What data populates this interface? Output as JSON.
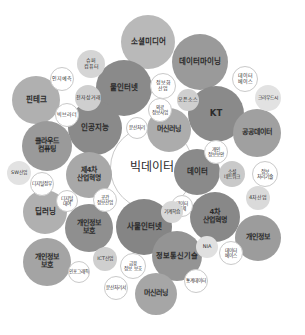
{
  "chart_data": {
    "type": "bubble",
    "title": "",
    "subtitle": "",
    "xlabel": "",
    "ylabel": "",
    "grid": false,
    "legend": "none",
    "palette": {
      "dark_gray": "#7d7d7d",
      "mid_gray": "#9a9a9a",
      "light_gray": "#b9b9b9",
      "pale_gray": "#d5d5d5",
      "very_pale": "#e8e8e8",
      "outline_white": "#ffffff",
      "outline_stroke": "#c9c9c9",
      "text": "#2b2b2b",
      "background": "#ffffff"
    },
    "bubbles": [
      {
        "label": "빅데이터",
        "cx": 152,
        "cy": 168,
        "r": 42,
        "fill": "#ffffff",
        "style": "outline",
        "font": 12,
        "weight": 400
      },
      {
        "label": "소셜미디어",
        "cx": 148,
        "cy": 42,
        "r": 27,
        "fill": "#b9b9b9",
        "style": "solid",
        "font": 7.5,
        "weight": 700
      },
      {
        "label": "데이터마이닝",
        "cx": 200,
        "cy": 62,
        "r": 28,
        "fill": "#9a9a9a",
        "style": "solid",
        "font": 7.5,
        "weight": 700
      },
      {
        "label": "물인터넷",
        "cx": 124,
        "cy": 88,
        "r": 28,
        "fill": "#8a8a8a",
        "style": "solid",
        "font": 7.5,
        "weight": 700
      },
      {
        "label": "KT",
        "cx": 216,
        "cy": 114,
        "r": 28,
        "fill": "#8a8a8a",
        "style": "solid",
        "font": 8.5,
        "weight": 700
      },
      {
        "label": "핀테크",
        "cx": 36,
        "cy": 100,
        "r": 24,
        "fill": "#b0b0b0",
        "style": "solid",
        "font": 7.5,
        "weight": 700
      },
      {
        "label": "인공지능",
        "cx": 95,
        "cy": 128,
        "r": 27,
        "fill": "#8a8a8a",
        "style": "solid",
        "font": 7.5,
        "weight": 700
      },
      {
        "label": "머신러닝",
        "cx": 169,
        "cy": 130,
        "r": 22,
        "fill": "#acacac",
        "style": "solid",
        "font": 7,
        "weight": 700
      },
      {
        "label": "공공데이터",
        "cx": 257,
        "cy": 133,
        "r": 24,
        "fill": "#a0a0a0",
        "style": "solid",
        "font": 7,
        "weight": 700
      },
      {
        "label": "클라우드\n컴퓨팅",
        "cx": 47,
        "cy": 146,
        "r": 25,
        "fill": "#9a9a9a",
        "style": "solid",
        "font": 7,
        "weight": 700
      },
      {
        "label": "제4차\n산업혁명",
        "cx": 89,
        "cy": 175,
        "r": 23,
        "fill": "#a8a8a8",
        "style": "solid",
        "font": 6.8,
        "weight": 700
      },
      {
        "label": "데이터",
        "cx": 197,
        "cy": 172,
        "r": 23,
        "fill": "#8a8a8a",
        "style": "solid",
        "font": 7.5,
        "weight": 700
      },
      {
        "label": "4차\n산업혁명",
        "cx": 215,
        "cy": 217,
        "r": 25,
        "fill": "#888888",
        "style": "solid",
        "font": 7,
        "weight": 700
      },
      {
        "label": "딥러닝",
        "cx": 45,
        "cy": 212,
        "r": 22,
        "fill": "#b0b0b0",
        "style": "solid",
        "font": 7.5,
        "weight": 700
      },
      {
        "label": "개인정보\n보호",
        "cx": 89,
        "cy": 228,
        "r": 24,
        "fill": "#8f8f8f",
        "style": "solid",
        "font": 7,
        "weight": 700
      },
      {
        "label": "사물인터넷",
        "cx": 144,
        "cy": 227,
        "r": 28,
        "fill": "#858585",
        "style": "solid",
        "font": 7.5,
        "weight": 700
      },
      {
        "label": "개인정보",
        "cx": 258,
        "cy": 238,
        "r": 23,
        "fill": "#9c9c9c",
        "style": "solid",
        "font": 7,
        "weight": 700
      },
      {
        "label": "개인정보\n보호",
        "cx": 47,
        "cy": 262,
        "r": 24,
        "fill": "#a4a4a4",
        "style": "solid",
        "font": 7,
        "weight": 700
      },
      {
        "label": "정보통신기술",
        "cx": 177,
        "cy": 256,
        "r": 25,
        "fill": "#949494",
        "style": "solid",
        "font": 7.2,
        "weight": 700
      },
      {
        "label": "머신러닝",
        "cx": 156,
        "cy": 294,
        "r": 21,
        "fill": "#a6a6a6",
        "style": "solid",
        "font": 7,
        "weight": 700
      },
      {
        "label": "슈퍼\n컴퓨터",
        "cx": 91,
        "cy": 64,
        "r": 14,
        "fill": "#d5d5d5",
        "style": "solid",
        "font": 5,
        "weight": 400
      },
      {
        "label": "인지예측",
        "cx": 62,
        "cy": 79,
        "r": 12,
        "fill": "#ffffff",
        "style": "outline",
        "font": 5,
        "weight": 400
      },
      {
        "label": "전자상거래",
        "cx": 88,
        "cy": 98,
        "r": 13,
        "fill": "#cfcfcf",
        "style": "solid",
        "font": 5,
        "weight": 400
      },
      {
        "label": "빅브라더",
        "cx": 67,
        "cy": 115,
        "r": 12,
        "fill": "#ffffff",
        "style": "outline",
        "font": 5,
        "weight": 400
      },
      {
        "label": "정보화\n산업",
        "cx": 163,
        "cy": 86,
        "r": 13,
        "fill": "#ffffff",
        "style": "outline",
        "font": 5,
        "weight": 400
      },
      {
        "label": "의료\n정보사업",
        "cx": 160,
        "cy": 110,
        "r": 12,
        "fill": "#ffffff",
        "style": "outline",
        "font": 4.6,
        "weight": 400
      },
      {
        "label": "오픈소스",
        "cx": 188,
        "cy": 100,
        "r": 11,
        "fill": "#cfcfcf",
        "style": "solid",
        "font": 5,
        "weight": 400
      },
      {
        "label": "문산처리",
        "cx": 137,
        "cy": 128,
        "r": 11,
        "fill": "#ffffff",
        "style": "outline",
        "font": 4.6,
        "weight": 400
      },
      {
        "label": "데이터\n베이스",
        "cx": 245,
        "cy": 79,
        "r": 13,
        "fill": "#ffffff",
        "style": "outline",
        "font": 5,
        "weight": 400
      },
      {
        "label": "크라우드시",
        "cx": 268,
        "cy": 98,
        "r": 13,
        "fill": "#e2e2e2",
        "style": "solid",
        "font": 4.8,
        "weight": 400
      },
      {
        "label": "개인\n정보보안",
        "cx": 216,
        "cy": 152,
        "r": 12,
        "fill": "#ffffff",
        "style": "outline",
        "font": 4.6,
        "weight": 400
      },
      {
        "label": "소셜\n네트워크",
        "cx": 232,
        "cy": 174,
        "r": 13,
        "fill": "#c9c9c9",
        "style": "solid",
        "font": 4.8,
        "weight": 400
      },
      {
        "label": "정보\n처리기술",
        "cx": 265,
        "cy": 174,
        "r": 13,
        "fill": "#ffffff",
        "style": "outline",
        "font": 4.8,
        "weight": 400
      },
      {
        "label": "4차산업",
        "cx": 258,
        "cy": 198,
        "r": 12,
        "fill": "#dadada",
        "style": "solid",
        "font": 5,
        "weight": 400
      },
      {
        "label": "데이터\n결제",
        "cx": 182,
        "cy": 206,
        "r": 11,
        "fill": "#ffffff",
        "style": "outline",
        "font": 4.6,
        "weight": 400
      },
      {
        "label": "기계학습",
        "cx": 172,
        "cy": 212,
        "r": 11,
        "fill": "#d8d8d8",
        "style": "solid",
        "font": 4.8,
        "weight": 400
      },
      {
        "label": "SW산업",
        "cx": 19,
        "cy": 173,
        "r": 12,
        "fill": "#e2e2e2",
        "style": "solid",
        "font": 4.8,
        "weight": 400
      },
      {
        "label": "디지털정부",
        "cx": 42,
        "cy": 184,
        "r": 12,
        "fill": "#ffffff",
        "style": "outline",
        "font": 4.6,
        "weight": 400
      },
      {
        "label": "디지털\n대여",
        "cx": 67,
        "cy": 201,
        "r": 11,
        "fill": "#ffffff",
        "style": "outline",
        "font": 4.6,
        "weight": 400
      },
      {
        "label": "공간\n정보산업",
        "cx": 105,
        "cy": 200,
        "r": 12,
        "fill": "#ffffff",
        "style": "outline",
        "font": 4.6,
        "weight": 400
      },
      {
        "label": "NIA",
        "cx": 207,
        "cy": 247,
        "r": 11,
        "fill": "#e0e0e0",
        "style": "solid",
        "font": 5,
        "weight": 400
      },
      {
        "label": "데이터\n베이스",
        "cx": 231,
        "cy": 253,
        "r": 12,
        "fill": "#ffffff",
        "style": "outline",
        "font": 4.6,
        "weight": 400
      },
      {
        "label": "ICT산업",
        "cx": 105,
        "cy": 259,
        "r": 12,
        "fill": "#cfcfcf",
        "style": "solid",
        "font": 4.8,
        "weight": 400
      },
      {
        "label": "금융\n정보 보호",
        "cx": 133,
        "cy": 266,
        "r": 13,
        "fill": "#ffffff",
        "style": "outline",
        "font": 4.6,
        "weight": 400
      },
      {
        "label": "인포그래픽",
        "cx": 79,
        "cy": 272,
        "r": 11,
        "fill": "#ffffff",
        "style": "outline",
        "font": 4.6,
        "weight": 400
      },
      {
        "label": "분산처리서",
        "cx": 116,
        "cy": 288,
        "r": 12,
        "fill": "#ffffff",
        "style": "outline",
        "font": 4.6,
        "weight": 400
      },
      {
        "label": "통계데이터",
        "cx": 196,
        "cy": 281,
        "r": 12,
        "fill": "#ffffff",
        "style": "outline",
        "font": 4.6,
        "weight": 400
      }
    ]
  }
}
